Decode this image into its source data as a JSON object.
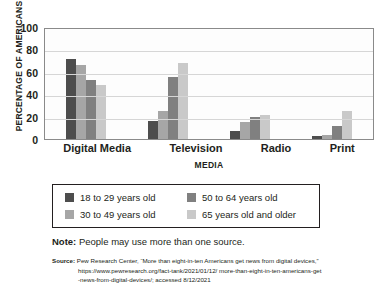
{
  "chart_data": {
    "type": "bar",
    "title": "",
    "xlabel": "MEDIA",
    "ylabel": "PERCENTAGE OF AMERICANS",
    "ylim": [
      0,
      100
    ],
    "yticks": [
      100,
      80,
      60,
      40,
      20,
      0
    ],
    "grid": true,
    "legend_position": "bottom",
    "categories": [
      "Digital Media",
      "Television",
      "Radio",
      "Print"
    ],
    "series": [
      {
        "name": "18 to 29 years old",
        "color": "#4d4d4d",
        "values": [
          71,
          16,
          7,
          3
        ]
      },
      {
        "name": "30 to 49 years old",
        "color": "#a6a6a6",
        "values": [
          66,
          25,
          15,
          4
        ]
      },
      {
        "name": "50 to 64 years old",
        "color": "#808080",
        "values": [
          53,
          55,
          20,
          12
        ]
      },
      {
        "name": "65 years old and older",
        "color": "#c9c9c9",
        "values": [
          48,
          68,
          21,
          25
        ]
      }
    ]
  },
  "axis": {
    "y_title": "PERCENTAGE OF AMERICANS",
    "x_title": "MEDIA",
    "y_ticks": [
      "100",
      "80",
      "60",
      "40",
      "20",
      "0"
    ],
    "x_ticks": [
      "Digital Media",
      "Television",
      "Radio",
      "Print"
    ]
  },
  "legend": {
    "items": [
      {
        "label": "18 to 29 years old",
        "color": "#4d4d4d"
      },
      {
        "label": "50 to 64 years old",
        "color": "#808080"
      },
      {
        "label": "30 to 49 years old",
        "color": "#a6a6a6"
      },
      {
        "label": "65 years old and older",
        "color": "#c9c9c9"
      }
    ]
  },
  "note": {
    "label": "Note:",
    "text": " People may use more than one source."
  },
  "source": {
    "label": "Source:",
    "line1": " Pew Research Center, “More than eight-in-ten Americans get news from digital devices,”",
    "line2": "https://www.pewresearch.org/fact-tank/2021/01/12/ more-than-eight-in-ten-americans-get",
    "line3": "-news-from-digital-devices/; accessed 8/12/2021"
  }
}
